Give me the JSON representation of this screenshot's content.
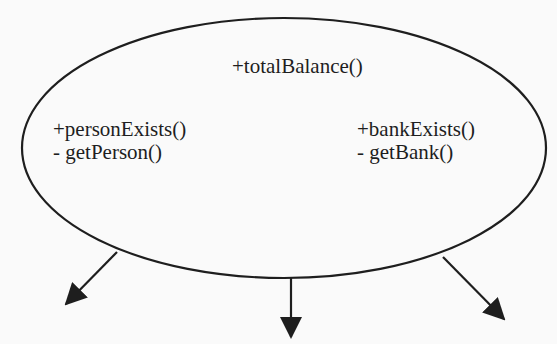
{
  "diagram": {
    "type": "class-operations-ellipse",
    "colors": {
      "background": "#fafafa",
      "stroke": "#1e1e1e",
      "text": "#1e1e1e"
    },
    "ellipse": {
      "cx": 284,
      "cy": 148,
      "rx": 262,
      "ry": 130
    },
    "top_method": "+totalBalance()",
    "left_group": {
      "methods": [
        "+personExists()",
        "- getPerson()"
      ]
    },
    "right_group": {
      "methods": [
        "+bankExists()",
        "- getBank()"
      ]
    },
    "arrows": [
      {
        "name": "left",
        "from": [
          117,
          252
        ],
        "to": [
          64,
          306
        ]
      },
      {
        "name": "center",
        "from": [
          291,
          278
        ],
        "to": [
          291,
          338
        ]
      },
      {
        "name": "right",
        "from": [
          443,
          257
        ],
        "to": [
          505,
          320
        ]
      }
    ]
  }
}
